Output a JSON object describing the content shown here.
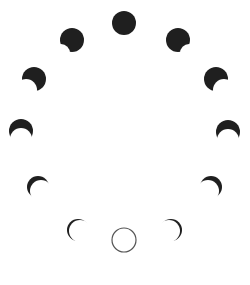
{
  "diagram": {
    "colors": {
      "background": "#ffffff",
      "moon_dark": "#1f1f1f",
      "new_moon_outline": "#555555"
    },
    "phases": [
      {
        "id": "full",
        "label": "full-moon",
        "cx": 124,
        "cy": 23,
        "r": 12,
        "shadow_dx": 0,
        "shadow_dy": 0,
        "shadow_r": 0,
        "style": "solid"
      },
      {
        "id": "ul1",
        "label": "gibbous-left",
        "cx": 72,
        "cy": 40,
        "r": 12,
        "shadow_dx": -11,
        "shadow_dy": 13,
        "shadow_r": 9,
        "style": "solid"
      },
      {
        "id": "ur1",
        "label": "gibbous-right",
        "cx": 178,
        "cy": 40,
        "r": 12,
        "shadow_dx": 11,
        "shadow_dy": 13,
        "shadow_r": 9,
        "style": "solid"
      },
      {
        "id": "ul2",
        "label": "half-left",
        "cx": 34,
        "cy": 79,
        "r": 12,
        "shadow_dx": -8,
        "shadow_dy": 11,
        "shadow_r": 11,
        "style": "solid"
      },
      {
        "id": "ur2",
        "label": "half-right",
        "cx": 216,
        "cy": 79,
        "r": 12,
        "shadow_dx": 8,
        "shadow_dy": 11,
        "shadow_r": 11,
        "style": "solid"
      },
      {
        "id": "l3",
        "label": "crescent-left",
        "cx": 21,
        "cy": 131,
        "r": 12,
        "shadow_dx": 0,
        "shadow_dy": 8,
        "shadow_r": 11,
        "style": "solid"
      },
      {
        "id": "r3",
        "label": "crescent-right",
        "cx": 228,
        "cy": 132,
        "r": 12,
        "shadow_dx": 0,
        "shadow_dy": 8,
        "shadow_r": 11,
        "style": "solid"
      },
      {
        "id": "ll4",
        "label": "thin-crescent-left",
        "cx": 38,
        "cy": 187,
        "r": 11,
        "shadow_dx": 3,
        "shadow_dy": 4,
        "shadow_r": 11,
        "style": "solid"
      },
      {
        "id": "lr4",
        "label": "thin-crescent-right",
        "cx": 211,
        "cy": 187,
        "r": 11,
        "shadow_dx": -3,
        "shadow_dy": 4,
        "shadow_r": 11,
        "style": "solid"
      },
      {
        "id": "ll5",
        "label": "sliver-left",
        "cx": 78,
        "cy": 230,
        "r": 11,
        "shadow_dx": 2,
        "shadow_dy": 1,
        "shadow_r": 11,
        "style": "solid"
      },
      {
        "id": "lr5",
        "label": "sliver-right",
        "cx": 171,
        "cy": 230,
        "r": 11,
        "shadow_dx": -2,
        "shadow_dy": 1,
        "shadow_r": 11,
        "style": "solid"
      },
      {
        "id": "new",
        "label": "new-moon",
        "cx": 124,
        "cy": 240,
        "r": 12,
        "shadow_dx": 0,
        "shadow_dy": 0,
        "shadow_r": 0,
        "style": "outline"
      }
    ]
  }
}
